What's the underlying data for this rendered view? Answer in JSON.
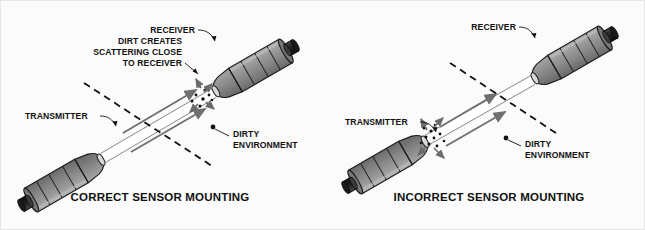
{
  "figure": {
    "background_color": "#fbfbfb",
    "border_color": "#e6e6e6",
    "text_color": "#111111",
    "body_fill": "#8c8c8c",
    "body_shade": "#6e6e6e",
    "body_highlight": "#a8a8a8",
    "beam_color": "#ffffff",
    "arrow_color": "#707070",
    "dot_color": "#111111",
    "dash_color": "#111111"
  },
  "panels": [
    {
      "id": "correct",
      "caption": "CORRECT SENSOR MOUNTING",
      "labels": {
        "receiver": "RECEIVER",
        "transmitter": "TRANSMITTER",
        "dirty_environment_line1": "DIRTY",
        "dirty_environment_line2": "ENVIRONMENT",
        "note_line1": "DIRT CREATES",
        "note_line2": "SCATTERING CLOSE",
        "note_line3": "TO RECEIVER"
      },
      "scatter_location": "receiver"
    },
    {
      "id": "incorrect",
      "caption": "INCORRECT SENSOR MOUNTING",
      "labels": {
        "receiver": "RECEIVER",
        "transmitter": "TRANSMITTER",
        "dirty_environment_line1": "DIRTY",
        "dirty_environment_line2": "ENVIRONMENT"
      },
      "scatter_location": "transmitter"
    }
  ]
}
